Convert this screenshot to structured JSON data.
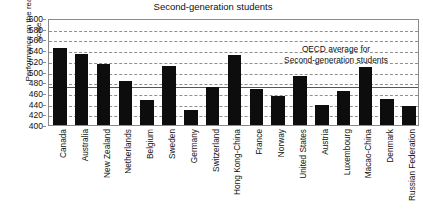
{
  "chart_data": {
    "type": "bar",
    "title": "Second-generation students",
    "xlabel": "",
    "ylabel": "Performance on the reading scale",
    "ylim": [
      400,
      600
    ],
    "ytick_step": 20,
    "yticks": [
      600,
      580,
      560,
      540,
      520,
      500,
      480,
      460,
      440,
      420,
      400
    ],
    "grid": true,
    "legend": "none",
    "bar_color": "#0d0d0d",
    "categories": [
      "Canada",
      "Australia",
      "New Zealand",
      "Netherlands",
      "Belgium",
      "Sweden",
      "Germany",
      "Switzerland",
      "Hong Kong-China",
      "France",
      "Norway",
      "United States",
      "Austria",
      "Luxembourg",
      "Macao-China",
      "Denmark",
      "Russian Federation"
    ],
    "values": [
      544,
      532,
      514,
      483,
      446,
      510,
      428,
      471,
      530,
      468,
      454,
      491,
      437,
      463,
      508,
      448,
      435
    ],
    "reference_line": {
      "label_line1": "OECD average for",
      "label_line2": "Second-generation students",
      "value": 475
    }
  }
}
